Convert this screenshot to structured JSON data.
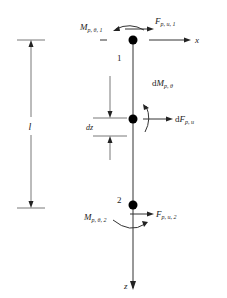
{
  "diagram": {
    "type": "beam-element-free-body",
    "axes": {
      "x_label": "x",
      "z_label": "z"
    },
    "nodes": [
      {
        "id": "1",
        "label": "1"
      },
      {
        "id": "mid",
        "label": ""
      },
      {
        "id": "2",
        "label": "2"
      }
    ],
    "labels": {
      "node1_moment_main": "M",
      "node1_moment_sub": "p, θ, 1",
      "node1_force_main": "F",
      "node1_force_sub": "p, u, 1",
      "mid_moment_prefix": "d",
      "mid_moment_main": "M",
      "mid_moment_sub": "p, θ",
      "mid_force_prefix": "d",
      "mid_force_main": "F",
      "mid_force_sub": "p, u",
      "node2_moment_main": "M",
      "node2_moment_sub": "p, θ, 2",
      "node2_force_main": "F",
      "node2_force_sub": "p, u, 2",
      "length": "l",
      "element_length": "dz"
    },
    "colors": {
      "stroke": "#333333",
      "node_fill": "#000000",
      "background": "#ffffff"
    }
  }
}
